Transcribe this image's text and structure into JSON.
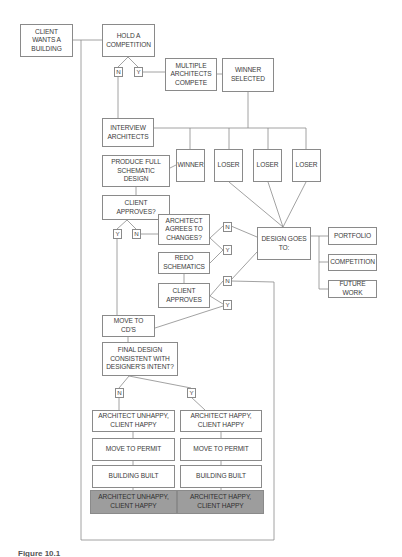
{
  "diagram": {
    "type": "flowchart",
    "nodes": {
      "client_wants": "CLIENT\nWANTS A\nBUILDING",
      "hold_competition": "HOLD A\nCOMPETITION",
      "multiple_architects": "MULTIPLE\nARCHITECTS\nCOMPETE",
      "winner_selected": "WINNER\nSELECTED",
      "interview_architects": "INTERVIEW\nARCHITECTS",
      "winner": "WINNER",
      "loser_1": "LOSER",
      "loser_2": "LOSER",
      "loser_3": "LOSER",
      "produce_schematic": "PRODUCE FULL\nSCHEMATIC\nDESIGN",
      "client_approves_q": "CLIENT\nAPPROVES?",
      "architect_agrees": "ARCHITECT\nAGREES TO\nCHANGES?",
      "redo_schematics": "REDO\nSCHEMATICS",
      "client_approves": "CLIENT\nAPPROVES",
      "design_goes_to": "DESIGN GOES\nTO:",
      "portfolio": "PORTFOLIO",
      "competition": "COMPETITION",
      "future_work": "FUTURE WORK",
      "move_to_cds": "MOVE TO\nCD'S",
      "final_design": "FINAL DESIGN\nCONSISTENT WITH\nDESIGNER'S INTENT?",
      "left_outcome": "ARCHITECT UNHAPPY,\nCLIENT HAPPY",
      "right_outcome": "ARCHITECT HAPPY,\nCLIENT HAPPY",
      "left_permit": "MOVE TO PERMIT",
      "right_permit": "MOVE TO PERMIT",
      "left_built": "BUILDING BUILT",
      "right_built": "BUILDING BUILT",
      "left_final": "ARCHITECT UNHAPPY,\nCLIENT HAPPY",
      "right_final": "ARCHITECT HAPPY,\nCLIENT HAPPY"
    },
    "decisions": {
      "hold_n": "N",
      "hold_y": "Y",
      "approves_y": "Y",
      "approves_n": "N",
      "agrees_n": "N",
      "agrees_y": "Y",
      "client_n": "N",
      "client_y": "Y",
      "final_n": "N",
      "final_y": "Y"
    },
    "colors": {
      "line": "#8a8a8a",
      "box_fill": "#ffffff",
      "final_fill": "#9d9d9d",
      "text": "#3a3a3a"
    }
  },
  "caption": "Figure 10.1"
}
